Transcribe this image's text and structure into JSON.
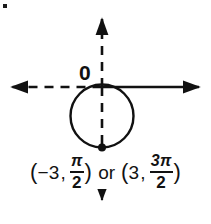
{
  "figure": {
    "origin_label": "0",
    "stroke_color": "#111111",
    "background_color": "#ffffff",
    "axes": {
      "horizontal": {
        "name": "polar-axis",
        "y": 87,
        "left_style": "dashed",
        "right_style": "solid",
        "left_arrow": true,
        "right_arrow": true,
        "x_start": 4,
        "x_end": 206
      },
      "vertical": {
        "name": "vertical-axis",
        "x": 102,
        "style": "dashed",
        "top_arrow": true,
        "bottom_arrow": true,
        "y_start": 12,
        "y_end": 200
      }
    },
    "circle": {
      "center_x": 102,
      "center_y": 116,
      "radius": 31,
      "style": "solid",
      "tangent_point": "origin"
    },
    "marked_point": {
      "x": 102,
      "y": 147,
      "radius": 4,
      "label": "plotted-point"
    }
  },
  "caption": {
    "first_point": {
      "open_paren": "(",
      "r": "−3",
      "comma": ",",
      "numerator": "π",
      "denominator": "2",
      "close_paren": ")"
    },
    "conjunction": "or",
    "second_point": {
      "open_paren": "(",
      "r": "3",
      "comma": ",",
      "numerator": "3π",
      "denominator": "2",
      "close_paren": ")"
    },
    "plain_text": "(−3, π/2) or (3, 3π/2)"
  }
}
